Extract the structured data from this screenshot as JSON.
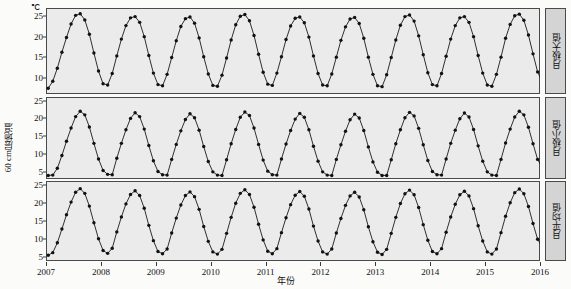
{
  "axes": {
    "unit": "℃",
    "ylabel": "60 cm层地温",
    "xlabel": "年份",
    "xticks": [
      "2007",
      "2008",
      "2009",
      "2010",
      "2011",
      "2012",
      "2013",
      "2014",
      "2015",
      "2016"
    ]
  },
  "strips": [
    {
      "label": "月极大值"
    },
    {
      "label": "月极小值"
    },
    {
      "label": "月平均值"
    }
  ],
  "colors": {
    "panel_background": "#ebebeb",
    "frame": "#4a4a4a",
    "strip_background": "#d4d4d4",
    "line": "#1a1a1a",
    "marker": "#111111",
    "text": "#111111"
  },
  "chart_data": {
    "type": "line",
    "title": "",
    "xlabel": "年份",
    "ylabel": "60 cm层地温",
    "unit": "℃",
    "grid": false,
    "legend": "none",
    "xlim": [
      2007.0,
      2016.0
    ],
    "x_tick_values": [
      2007,
      2008,
      2009,
      2010,
      2011,
      2012,
      2013,
      2014,
      2015,
      2016
    ],
    "x_start": 2007.04,
    "x_step": 0.08333,
    "n_points": 107,
    "panels": [
      {
        "name": "monthly-maximum",
        "strip_label": "月极大值",
        "ylim": [
          6.0,
          27.0
        ],
        "yticks": [
          10,
          15,
          20,
          25
        ],
        "values": [
          7.4,
          9.1,
          12.3,
          16.2,
          19.8,
          23.1,
          25.2,
          25.6,
          24.1,
          20.6,
          16.0,
          11.6,
          8.5,
          8.2,
          11.0,
          15.3,
          19.4,
          22.7,
          24.6,
          24.9,
          23.5,
          20.0,
          15.4,
          11.1,
          8.3,
          8.0,
          10.8,
          14.9,
          19.0,
          22.5,
          24.4,
          24.8,
          23.3,
          19.7,
          15.1,
          10.9,
          8.1,
          7.9,
          10.6,
          14.8,
          19.2,
          22.9,
          25.0,
          25.4,
          23.9,
          20.3,
          15.7,
          11.3,
          8.4,
          8.1,
          11.1,
          15.1,
          19.3,
          22.6,
          24.5,
          24.8,
          23.4,
          19.9,
          15.3,
          11.0,
          8.2,
          8.0,
          10.9,
          15.0,
          19.1,
          22.4,
          24.3,
          24.7,
          23.2,
          19.6,
          15.0,
          10.8,
          8.0,
          7.8,
          10.7,
          14.9,
          19.2,
          22.8,
          24.9,
          25.3,
          23.8,
          20.2,
          15.6,
          11.2,
          8.3,
          8.0,
          11.0,
          15.2,
          19.4,
          22.7,
          24.6,
          24.9,
          23.5,
          20.0,
          15.4,
          11.1,
          8.2,
          7.9,
          10.8,
          15.0,
          19.6,
          23.0,
          25.1,
          25.5,
          24.0,
          20.4,
          15.8,
          11.4,
          9.0
        ]
      },
      {
        "name": "monthly-minimum",
        "strip_label": "月极小值",
        "ylim": [
          3.0,
          26.0
        ],
        "yticks": [
          5,
          10,
          15,
          20,
          25
        ],
        "values": [
          4.0,
          4.1,
          6.0,
          9.6,
          13.6,
          17.3,
          20.5,
          22.0,
          21.0,
          17.6,
          13.0,
          8.6,
          5.4,
          4.3,
          4.2,
          8.8,
          13.0,
          16.8,
          20.0,
          21.6,
          20.5,
          17.0,
          12.4,
          8.1,
          5.1,
          4.2,
          4.1,
          8.5,
          12.7,
          16.5,
          19.7,
          21.3,
          20.2,
          16.7,
          12.1,
          7.9,
          5.0,
          4.1,
          4.0,
          8.4,
          12.9,
          16.9,
          20.3,
          21.8,
          20.8,
          17.3,
          12.7,
          8.3,
          5.2,
          4.2,
          4.1,
          8.6,
          12.8,
          16.6,
          19.8,
          21.4,
          20.3,
          16.8,
          12.2,
          8.0,
          5.0,
          4.1,
          4.0,
          8.5,
          12.6,
          16.4,
          19.6,
          21.2,
          20.1,
          16.6,
          12.0,
          7.8,
          4.9,
          4.0,
          4.0,
          8.4,
          12.9,
          16.8,
          20.2,
          21.7,
          20.7,
          17.2,
          12.6,
          8.2,
          5.1,
          4.2,
          4.1,
          8.6,
          13.0,
          16.7,
          19.9,
          21.5,
          20.4,
          16.9,
          12.3,
          8.0,
          5.0,
          4.1,
          4.0,
          8.5,
          13.1,
          17.0,
          20.4,
          22.0,
          21.0,
          17.5,
          12.9,
          8.5,
          6.2
        ]
      },
      {
        "name": "monthly-average",
        "strip_label": "月平均值",
        "ylim": [
          4.0,
          26.0
        ],
        "yticks": [
          5,
          10,
          15,
          20,
          25
        ],
        "values": [
          5.6,
          6.3,
          9.0,
          12.8,
          16.7,
          20.2,
          22.9,
          23.9,
          22.6,
          19.1,
          14.5,
          10.1,
          6.9,
          6.1,
          7.5,
          12.0,
          16.1,
          19.7,
          22.3,
          23.3,
          22.0,
          18.5,
          13.8,
          9.6,
          6.6,
          6.0,
          7.3,
          11.7,
          15.8,
          19.4,
          22.0,
          23.0,
          21.7,
          18.2,
          13.5,
          9.4,
          6.5,
          5.9,
          7.2,
          11.6,
          16.0,
          19.9,
          22.6,
          23.6,
          22.3,
          18.8,
          14.1,
          9.8,
          6.7,
          6.0,
          7.4,
          11.8,
          15.9,
          19.5,
          22.1,
          23.1,
          21.8,
          18.3,
          13.6,
          9.5,
          6.5,
          5.9,
          7.3,
          11.7,
          15.7,
          19.3,
          21.9,
          22.9,
          21.6,
          18.1,
          13.4,
          9.3,
          6.4,
          5.8,
          7.2,
          11.6,
          16.0,
          19.8,
          22.5,
          23.5,
          22.2,
          18.7,
          14.0,
          9.7,
          6.6,
          6.0,
          7.4,
          11.9,
          16.1,
          19.6,
          22.2,
          23.2,
          21.9,
          18.4,
          13.7,
          9.5,
          6.5,
          5.9,
          7.3,
          11.8,
          16.3,
          20.0,
          22.8,
          23.8,
          22.5,
          19.0,
          14.3,
          10.0,
          7.8
        ]
      }
    ]
  }
}
